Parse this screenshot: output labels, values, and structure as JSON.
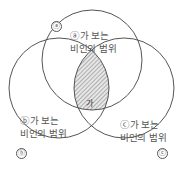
{
  "diagram": {
    "type": "venn",
    "circles": [
      {
        "id": "a",
        "marker": "ⓐ",
        "line1": "ⓐ가 보는",
        "line2": "비인의 범위",
        "cx": 92,
        "cy": 60,
        "r": 50
      },
      {
        "id": "b",
        "marker": "ⓑ",
        "line1": "ⓑ가 보는",
        "line2": "비인의 범위",
        "cx": 59,
        "cy": 88,
        "r": 50
      },
      {
        "id": "c",
        "marker": "ⓒ",
        "line1": "ⓒ가 보는",
        "line2": "비인의 범위",
        "cx": 124,
        "cy": 88,
        "r": 50
      }
    ],
    "intersection": {
      "label": "가",
      "fill": "hatched"
    },
    "colors": {
      "stroke": "#555555",
      "hatch": "#777777",
      "hatch_bg": "#e6e6e6"
    }
  }
}
